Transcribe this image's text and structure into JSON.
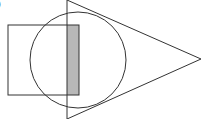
{
  "figure": {
    "label": ")",
    "colors": {
      "stroke": "#333333",
      "shaded": "#b8b8b8",
      "background": "#ffffff"
    },
    "shapes": {
      "square": {
        "x": 8,
        "y": 25,
        "width": 71,
        "height": 70
      },
      "circle": {
        "cx": 78,
        "cy": 60,
        "r": 48
      },
      "triangle": {
        "points": "67,0 201,59 67,119"
      },
      "shaded_region": {
        "x": 67,
        "y": 25,
        "width": 12,
        "height": 70
      }
    }
  }
}
